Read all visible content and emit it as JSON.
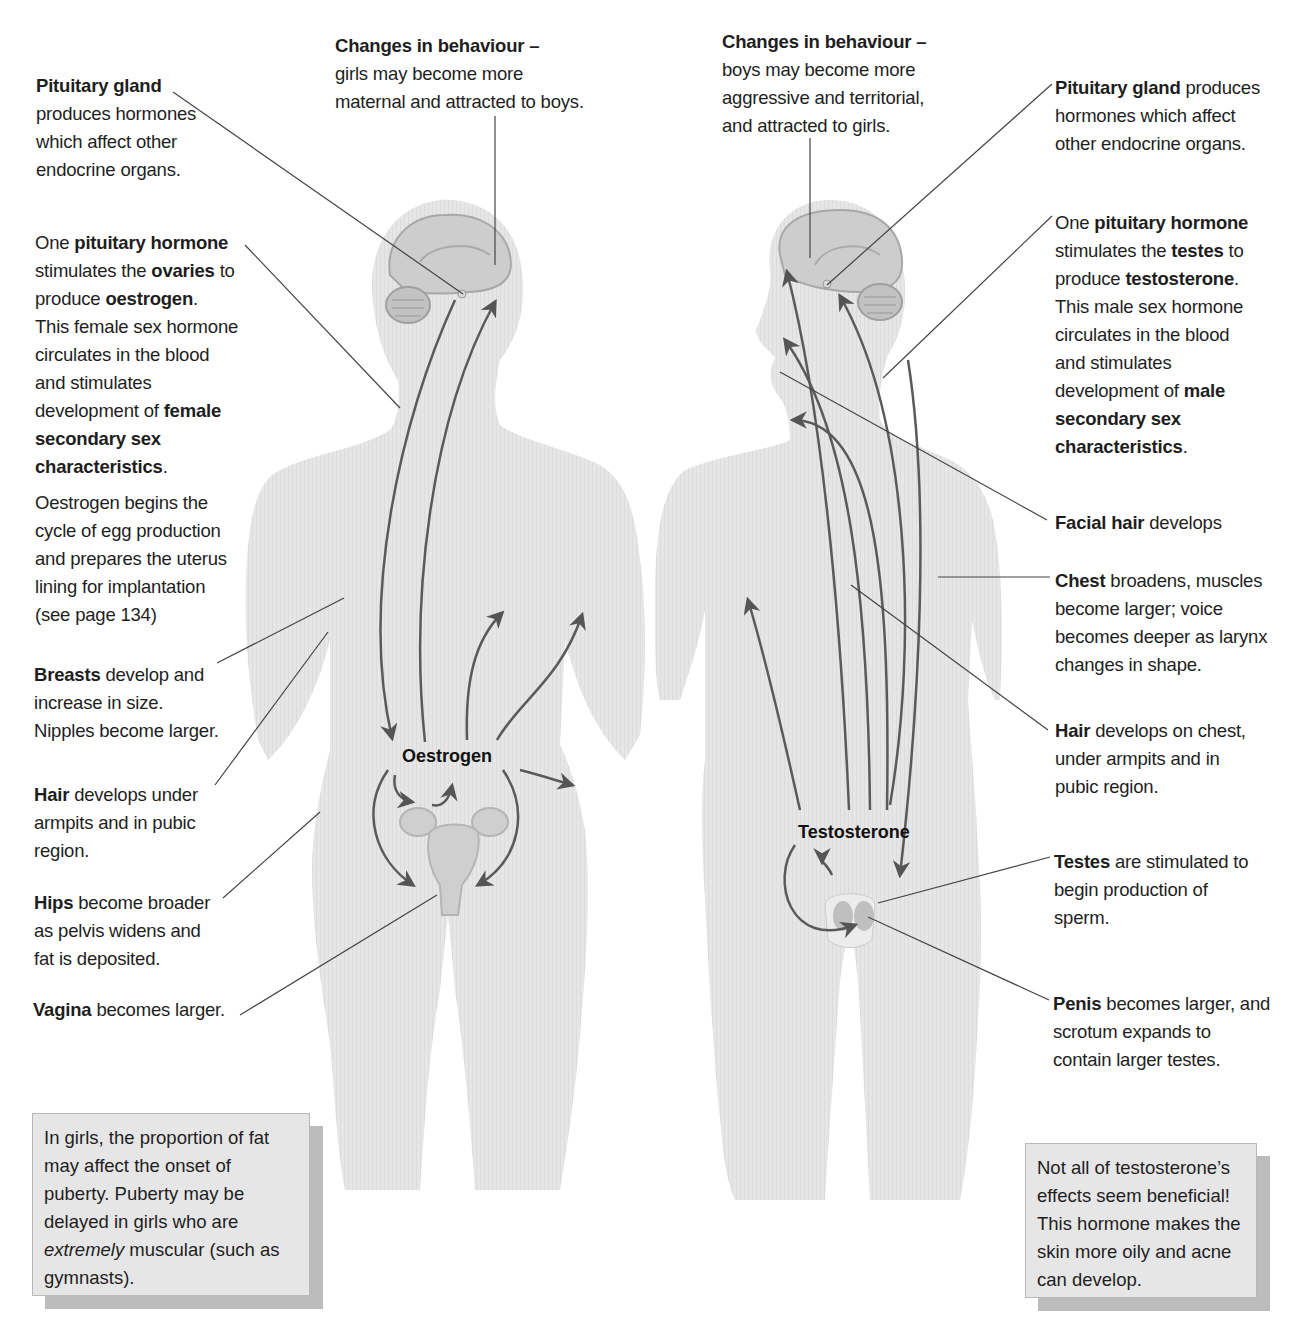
{
  "colors": {
    "body_fill": "#e4e4e4",
    "brain_fill": "#cfcfcf",
    "arrow": "#555555",
    "leader_line": "#444444",
    "note_bg": "#e6e6e6",
    "note_shadow": "#bcbcbc",
    "text": "#1e1e1e"
  },
  "female": {
    "hormone_label": "Oestrogen",
    "labels": [
      {
        "id": "behaviour",
        "bold": "Changes in behaviour –",
        "l1": "girls may become more",
        "l2": "maternal and attracted to boys."
      },
      {
        "id": "pituitary_gland",
        "bold": "Pituitary gland",
        "l1": "produces hormones",
        "l2": "which affect other",
        "l3": "endocrine organs."
      },
      {
        "id": "pituitary_hormone",
        "pre": "One ",
        "bold": "pituitary hormone",
        "l1a": "stimulates the ",
        "l1b": "ovaries",
        "l1c": " to",
        "l2a": "produce ",
        "l2b": "oestrogen",
        "l2c": ".",
        "l3": "This female sex hormone",
        "l4": "circulates in the blood",
        "l5": "and stimulates",
        "l6a": "development of ",
        "l6b": "female",
        "l7": "secondary sex",
        "l8a": "characteristics",
        "l8b": "."
      },
      {
        "id": "egg_cycle",
        "l1": "Oestrogen begins the",
        "l2": "cycle of egg production",
        "l3": "and prepares the uterus",
        "l4": "lining for implantation",
        "l5": "(see page 134)"
      },
      {
        "id": "breasts",
        "bold": "Breasts",
        "rest": " develop and",
        "l2": "increase in size.",
        "l3": "Nipples become larger."
      },
      {
        "id": "hair",
        "bold": "Hair",
        "rest": " develops under",
        "l2": "armpits and in pubic",
        "l3": "region."
      },
      {
        "id": "hips",
        "bold": "Hips",
        "rest": " become broader",
        "l2": "as pelvis widens and",
        "l3": "fat is deposited."
      },
      {
        "id": "vagina",
        "bold": "Vagina",
        "rest": " becomes larger."
      }
    ],
    "note": {
      "l1": "In girls, the proportion of fat",
      "l2": "may affect the onset of",
      "l3": "puberty. Puberty may be",
      "l4": "delayed in girls who are",
      "l5_italic": "extremely",
      "l5_rest": " muscular (such as",
      "l6": "gymnasts)."
    }
  },
  "male": {
    "hormone_label": "Testosterone",
    "labels": [
      {
        "id": "behaviour",
        "bold": "Changes in behaviour –",
        "l1": "boys may become more",
        "l2": "aggressive and territorial,",
        "l3": "and attracted to girls."
      },
      {
        "id": "pituitary_gland",
        "bold": "Pituitary gland",
        "rest": " produces",
        "l2": "hormones which affect",
        "l3": "other endocrine organs."
      },
      {
        "id": "pituitary_hormone",
        "pre": "One ",
        "bold": "pituitary hormone",
        "l1a": "stimulates the ",
        "l1b": "testes",
        "l1c": " to",
        "l2a": "produce ",
        "l2b": "testosterone",
        "l2c": ".",
        "l3": "This male sex hormone",
        "l4": "circulates in the blood",
        "l5": "and stimulates",
        "l6a": "development of ",
        "l6b": "male",
        "l7": "secondary sex",
        "l8a": "characteristics",
        "l8b": "."
      },
      {
        "id": "facial_hair",
        "bold": "Facial hair",
        "rest": " develops"
      },
      {
        "id": "chest",
        "bold": "Chest",
        "rest": " broadens, muscles",
        "l2": "become larger; voice",
        "l3": "becomes deeper as larynx",
        "l4": "changes in shape."
      },
      {
        "id": "hair",
        "bold": "Hair",
        "rest": " develops on chest,",
        "l2": "under armpits and in",
        "l3": "pubic region."
      },
      {
        "id": "testes",
        "bold": "Testes",
        "rest": " are stimulated to",
        "l2": "begin production of",
        "l3": "sperm."
      },
      {
        "id": "penis",
        "bold": "Penis",
        "rest": " becomes larger, and",
        "l2": "scrotum expands to",
        "l3": "contain larger testes."
      }
    ],
    "note": {
      "l1": "Not all of testosterone’s",
      "l2": "effects seem beneficial!",
      "l3": "This hormone makes the",
      "l4": "skin more oily and acne",
      "l5": "can develop."
    }
  }
}
